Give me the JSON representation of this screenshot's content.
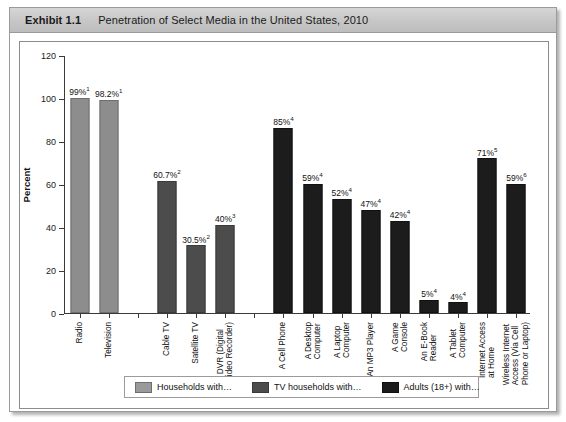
{
  "exhibit": {
    "number": "Exhibit 1.1",
    "title": "Penetration of Select Media in the United States, 2010"
  },
  "chart_data": {
    "type": "bar",
    "title": "Penetration of Select Media in the United States, 2010",
    "xlabel": "",
    "ylabel": "Percent",
    "ylim": [
      0,
      120
    ],
    "yticks": [
      "0",
      "20",
      "40",
      "60",
      "80",
      "100",
      "120"
    ],
    "grid": false,
    "legend_position": "bottom",
    "categories": [
      "Radio",
      "Television",
      "Cable TV",
      "Satellite TV",
      "A DVR (Digital\nVideo Recorder)",
      "A Cell Phone",
      "A Desktop\nComputer",
      "A Laptop\nComputer",
      "An MP3 Player",
      "A Game\nConsole",
      "An E-Book\nReader",
      "A Tablet\nComputer",
      "Internet Access\nat Home",
      "Wireless Internet\nAccess (Via Cell\nPhone or Laptop)"
    ],
    "values": [
      99,
      98.2,
      60.7,
      30.5,
      40,
      85,
      59,
      52,
      47,
      42,
      5,
      4,
      71,
      59
    ],
    "data_labels": [
      "99%",
      "98.2%",
      "60.7%",
      "30.5%",
      "40%",
      "85%",
      "59%",
      "52%",
      "47%",
      "42%",
      "5%",
      "4%",
      "71%",
      "59%"
    ],
    "footnote_markers": [
      "1",
      "1",
      "2",
      "2",
      "3",
      "4",
      "4",
      "4",
      "4",
      "4",
      "4",
      "4",
      "5",
      "6"
    ],
    "series_group": [
      "households",
      "households",
      "tv_households",
      "tv_households",
      "tv_households",
      "adults",
      "adults",
      "adults",
      "adults",
      "adults",
      "adults",
      "adults",
      "adults",
      "adults"
    ],
    "legend": [
      {
        "key": "households",
        "label": "Households with…",
        "color": "#9a9a9a"
      },
      {
        "key": "tv_households",
        "label": "TV households with…",
        "color": "#4c4c4c"
      },
      {
        "key": "adults",
        "label": "Adults (18+) with…",
        "color": "#1c1c1c"
      }
    ],
    "empty_slots_after": [
      1,
      4
    ]
  }
}
